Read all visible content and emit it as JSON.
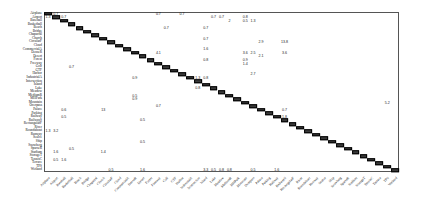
{
  "chart_data": {
    "type": "heatmap",
    "title": "",
    "xlabel": "Predicted class",
    "ylabel": "True class",
    "grid": false,
    "legend": null,
    "value_format": "percent",
    "classes": [
      "Airplane",
      "Airport",
      "Baseball",
      "Basketball",
      "Beach",
      "Bridge",
      "Chaparral",
      "Church",
      "CircularF",
      "Cloud",
      "CommercialA",
      "DenseR",
      "Desert",
      "Forest",
      "Freeway",
      "Golf",
      "GTF",
      "Harbor",
      "IndustrialA",
      "Intersection",
      "Island",
      "Lake",
      "Meadow",
      "MediumR",
      "MHPark",
      "Mountain",
      "Overpass",
      "Palace",
      "Parking",
      "Railway",
      "RailwayS",
      "RectangularF",
      "River",
      "Roundabout",
      "Runway",
      "SeaIce",
      "Ship",
      "Snowberg",
      "SparseR",
      "Stadium",
      "StorageT",
      "TennisC",
      "Terrace",
      "TPS",
      "Wetland"
    ],
    "diagonal_note": "Diagonal cells shown as dark filled boxes (high accuracy values, ~90-100)",
    "off_diagonal": [
      {
        "row": "Airplane",
        "col": "Airport",
        "value": 0.7
      },
      {
        "row": "Airport",
        "col": "Airplane",
        "value": 1.3
      },
      {
        "row": "Airport",
        "col": "Baseball",
        "value": 0.7
      },
      {
        "row": "Airplane",
        "col": "Freeway",
        "value": 0.7
      },
      {
        "row": "Airplane",
        "col": "Harbor",
        "value": 0.7
      },
      {
        "row": "Airport",
        "col": "Lake",
        "value": 0.7
      },
      {
        "row": "Airport",
        "col": "Meadow",
        "value": 0.7
      },
      {
        "row": "Airport",
        "col": "Mountain",
        "value": 0.8
      },
      {
        "row": "Baseball",
        "col": "MediumR",
        "value": 2.0
      },
      {
        "row": "Baseball",
        "col": "Mountain",
        "value": 0.5
      },
      {
        "row": "Baseball",
        "col": "Overpass",
        "value": 1.3
      },
      {
        "row": "Beach",
        "col": "Golf",
        "value": 0.7
      },
      {
        "row": "Beach",
        "col": "Island",
        "value": 0.7
      },
      {
        "row": "Church",
        "col": "Island",
        "value": 0.7
      },
      {
        "row": "CircularF",
        "col": "Palace",
        "value": 2.9
      },
      {
        "row": "CircularF",
        "col": "RailwayS",
        "value": 13.8
      },
      {
        "row": "CommercialA",
        "col": "Island",
        "value": 1.6
      },
      {
        "row": "DenseR",
        "col": "Freeway",
        "value": 4.1
      },
      {
        "row": "DenseR",
        "col": "Mountain",
        "value": 3.6
      },
      {
        "row": "DenseR",
        "col": "Overpass",
        "value": 2.5
      },
      {
        "row": "DenseR",
        "col": "RailwayS",
        "value": 3.6
      },
      {
        "row": "Desert",
        "col": "Palace",
        "value": 2.1
      },
      {
        "row": "Forest",
        "col": "Island",
        "value": 0.8
      },
      {
        "row": "Forest",
        "col": "Mountain",
        "value": 0.9
      },
      {
        "row": "Freeway",
        "col": "Mountain",
        "value": 1.4
      },
      {
        "row": "Golf",
        "col": "Basketball",
        "value": 0.7
      },
      {
        "row": "Harbor",
        "col": "Overpass",
        "value": 2.7
      },
      {
        "row": "IndustrialA",
        "col": "DenseR",
        "value": 0.9
      },
      {
        "row": "IndustrialA",
        "col": "Intersection",
        "value": 1.3
      },
      {
        "row": "IndustrialA",
        "col": "Island",
        "value": 0.8
      },
      {
        "row": "Lake",
        "col": "Intersection",
        "value": 0.8
      },
      {
        "row": "MediumR",
        "col": "DenseR",
        "value": 0.5
      },
      {
        "row": "MHPark",
        "col": "DenseR",
        "value": 0.9
      },
      {
        "row": "Mountain",
        "col": "TPS",
        "value": 5.2
      },
      {
        "row": "Overpass",
        "col": "Freeway",
        "value": 0.7
      },
      {
        "row": "Palace",
        "col": "Baseball",
        "value": 0.6
      },
      {
        "row": "Palace",
        "col": "Church",
        "value": 13.0
      },
      {
        "row": "Palace",
        "col": "RailwayS",
        "value": 0.7
      },
      {
        "row": "Railway",
        "col": "Baseball",
        "value": 0.5
      },
      {
        "row": "Railway",
        "col": "RailwayS",
        "value": 1.8
      },
      {
        "row": "RailwayS",
        "col": "Desert",
        "value": 0.5
      },
      {
        "row": "Roundabout",
        "col": "Airport",
        "value": 3.2
      },
      {
        "row": "Roundabout",
        "col": "Airplane",
        "value": 1.3
      },
      {
        "row": "Ship",
        "col": "Desert",
        "value": 0.5
      },
      {
        "row": "SparseR",
        "col": "Basketball",
        "value": 0.5
      },
      {
        "row": "Stadium",
        "col": "Airport",
        "value": 1.6
      },
      {
        "row": "Stadium",
        "col": "Church",
        "value": 1.4
      },
      {
        "row": "TennisC",
        "col": "Airport",
        "value": 0.5
      },
      {
        "row": "TennisC",
        "col": "Baseball",
        "value": 1.6
      },
      {
        "row": "Wetland",
        "col": "CircularF",
        "value": 0.5
      },
      {
        "row": "Wetland",
        "col": "Desert",
        "value": 1.6
      },
      {
        "row": "Wetland",
        "col": "Island",
        "value": 3.3
      },
      {
        "row": "Wetland",
        "col": "Lake",
        "value": 0.5
      },
      {
        "row": "Wetland",
        "col": "Meadow",
        "value": 0.8
      },
      {
        "row": "Wetland",
        "col": "MediumR",
        "value": 0.8
      },
      {
        "row": "Wetland",
        "col": "Overpass",
        "value": 0.5
      },
      {
        "row": "Wetland",
        "col": "Railway",
        "value": 1.6
      }
    ]
  },
  "labels": {
    "y": [
      "Airplane",
      "Airport",
      "Baseball",
      "Basketball",
      "Beach",
      "Bridge",
      "Chaparral",
      "Church",
      "CircularF",
      "Cloud",
      "CommercialA",
      "DenseR",
      "Desert",
      "Forest",
      "Freeway",
      "Golf",
      "GTF",
      "Harbor",
      "IndustrialA",
      "Intersection",
      "Island",
      "Lake",
      "Meadow",
      "MediumR",
      "MHPark",
      "Mountain",
      "Overpass",
      "Palace",
      "Parking",
      "Railway",
      "RailwayS",
      "RectangularF",
      "River",
      "Roundabout",
      "Runway",
      "SeaIce",
      "Ship",
      "Snowberg",
      "SparseR",
      "Stadium",
      "StorageT",
      "TennisC",
      "Terrace",
      "TPS",
      "Wetland"
    ],
    "x": [
      "Airplane",
      "Airport",
      "Baseball",
      "Basketball",
      "Beach",
      "Bridge",
      "Chaparral",
      "Church",
      "CircularF",
      "Cloud",
      "CommercialA",
      "DenseR",
      "Desert",
      "Forest",
      "Freeway",
      "Golf",
      "GTF",
      "Harbor",
      "IndustrialA",
      "Intersection",
      "Island",
      "Lake",
      "Meadow",
      "MediumR",
      "MHPark",
      "Mountain",
      "Overpass",
      "Palace",
      "Parking",
      "Railway",
      "RailwayS",
      "RectangularF",
      "River",
      "Roundabout",
      "Runway",
      "SeaIce",
      "Ship",
      "Snowberg",
      "SparseR",
      "Stadium",
      "StorageT",
      "TennisC",
      "Terrace",
      "TPS",
      "Wetland"
    ]
  }
}
